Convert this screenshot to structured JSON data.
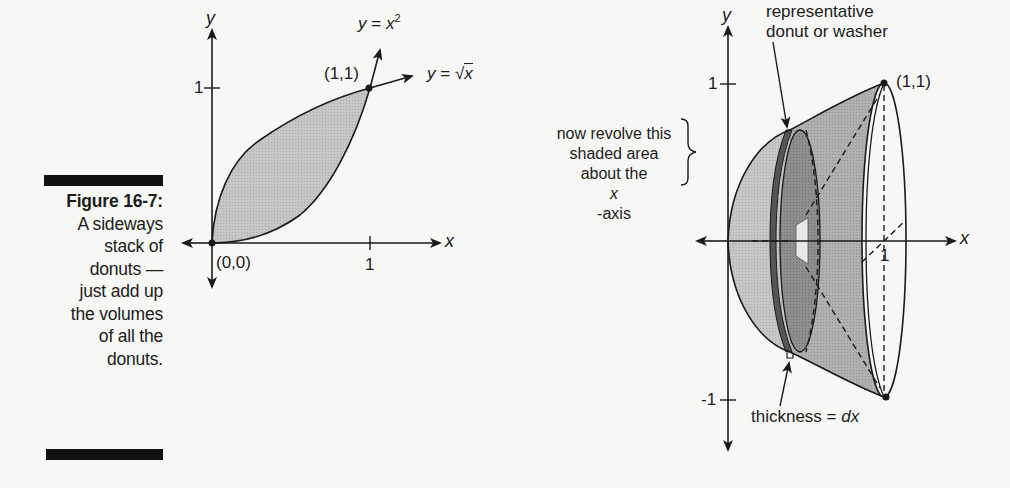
{
  "caption": {
    "title": "Figure 16-7:",
    "lines": [
      "A sideways",
      "stack of",
      "donuts —",
      "just add up",
      "the volumes",
      "of all the",
      "donuts."
    ]
  },
  "left_graph": {
    "y_axis_label": "y",
    "x_axis_label": "x",
    "y_tick_label": "1",
    "x_tick_label": "1",
    "origin_label": "(0,0)",
    "intersection_label": "(1,1)",
    "curve1_label_prefix": "y = x",
    "curve1_label_exp": "2",
    "curve2_label_prefix": "y = ",
    "curve2_label_radicand": "x"
  },
  "annotation": {
    "lines": [
      "now revolve this",
      "shaded area",
      "about the "
    ],
    "italic_x": "x",
    "suffix": "-axis"
  },
  "right_graph": {
    "y_axis_label": "y",
    "x_axis_label": "x",
    "y_tick_top": "1",
    "y_tick_bottom": "-1",
    "x_tick_label": "1",
    "point_label": "(1,1)",
    "washer_label_line1": "representative",
    "washer_label_line2": "donut or washer",
    "thickness_label_prefix": "thickness = ",
    "thickness_label_var": "dx"
  },
  "colors": {
    "shade_light": "#c9c9c9",
    "shade_mid": "#b3b3b3",
    "shade_dark": "#8a8a8a",
    "washer_dark": "#5a5a5a",
    "line": "#1a1a1a",
    "background": "#f7f7f5"
  }
}
